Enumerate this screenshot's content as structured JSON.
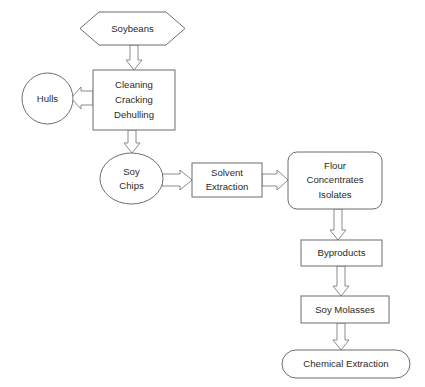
{
  "diagram": {
    "background_color": "#ffffff",
    "shape_stroke_color": "#6d6d6d",
    "arrow_stroke_color": "#8a8a8a",
    "text_color": "#2b2b2b",
    "nodes": [
      {
        "id": "soybeans",
        "shape": "hexagon",
        "lines": [
          "Soybeans"
        ]
      },
      {
        "id": "cleaning",
        "shape": "rectangle",
        "lines": [
          "Cleaning",
          "Cracking",
          "Dehulling"
        ]
      },
      {
        "id": "hulls",
        "shape": "circle",
        "lines": [
          "Hulls"
        ]
      },
      {
        "id": "soychips",
        "shape": "ellipse",
        "lines": [
          "Soy",
          "Chips"
        ]
      },
      {
        "id": "solvent",
        "shape": "rectangle",
        "lines": [
          "Solvent",
          "Extraction"
        ]
      },
      {
        "id": "flour",
        "shape": "rounded-rectangle",
        "lines": [
          "Flour",
          "Concentrates",
          "Isolates"
        ]
      },
      {
        "id": "byproducts",
        "shape": "rectangle",
        "lines": [
          "Byproducts"
        ]
      },
      {
        "id": "molasses",
        "shape": "rectangle",
        "lines": [
          "Soy Molasses"
        ]
      },
      {
        "id": "chemical",
        "shape": "stadium",
        "lines": [
          "Chemical Extraction"
        ]
      }
    ],
    "edges": [
      {
        "from": "soybeans",
        "to": "cleaning",
        "direction": "down"
      },
      {
        "from": "cleaning",
        "to": "hulls",
        "direction": "left"
      },
      {
        "from": "cleaning",
        "to": "soychips",
        "direction": "down"
      },
      {
        "from": "soychips",
        "to": "solvent",
        "direction": "right"
      },
      {
        "from": "solvent",
        "to": "flour",
        "direction": "right"
      },
      {
        "from": "flour",
        "to": "byproducts",
        "direction": "down"
      },
      {
        "from": "byproducts",
        "to": "molasses",
        "direction": "down"
      },
      {
        "from": "molasses",
        "to": "chemical",
        "direction": "down"
      }
    ],
    "labels": {
      "soybeans": "Soybeans",
      "cleaning_1": "Cleaning",
      "cleaning_2": "Cracking",
      "cleaning_3": "Dehulling",
      "hulls": "Hulls",
      "soychips_1": "Soy",
      "soychips_2": "Chips",
      "solvent_1": "Solvent",
      "solvent_2": "Extraction",
      "flour_1": "Flour",
      "flour_2": "Concentrates",
      "flour_3": "Isolates",
      "byproducts": "Byproducts",
      "molasses": "Soy Molasses",
      "chemical": "Chemical Extraction"
    }
  }
}
